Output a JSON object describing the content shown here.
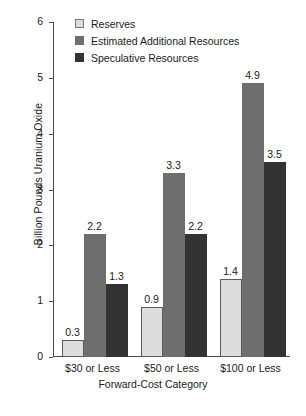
{
  "chart_data": {
    "type": "bar",
    "title": "",
    "xlabel": "Forward-Cost Category",
    "ylabel": "Billion Pounds Uranium Oxide",
    "categories": [
      "$30 or Less",
      "$50 or Less",
      "$100 or Less"
    ],
    "series": [
      {
        "name": "Reserves",
        "color": "#dcdcdc",
        "values": [
          0.3,
          0.9,
          1.4
        ],
        "labels": [
          "0.3",
          "0.9",
          "1.4"
        ]
      },
      {
        "name": "Estimated Additional Resources",
        "color": "#6e6e6e",
        "values": [
          2.2,
          3.3,
          4.9
        ],
        "labels": [
          "2.2",
          "3.3",
          "4.9"
        ]
      },
      {
        "name": "Speculative Resources",
        "color": "#333333",
        "values": [
          1.3,
          2.2,
          3.5
        ],
        "labels": [
          "1.3",
          "2.2",
          "3.5"
        ]
      }
    ],
    "ylim": [
      0,
      6
    ],
    "yticks": [
      0,
      1,
      2,
      3,
      4,
      5,
      6
    ],
    "ytick_labels": [
      "0",
      "1",
      "2",
      "3",
      "4",
      "5",
      "6"
    ],
    "grid": false,
    "legend_position": "top-left-inside"
  }
}
